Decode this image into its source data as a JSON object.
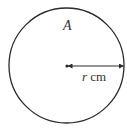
{
  "diagram": {
    "shape": "circle",
    "area_label": "A",
    "radius_label_var": "r",
    "radius_label_unit": " cm",
    "colors": {
      "stroke": "#2b2b2b",
      "text": "#333333",
      "background": "#ffffff"
    }
  }
}
